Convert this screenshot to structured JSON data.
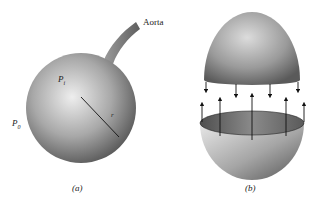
{
  "figure": {
    "panel_a": {
      "caption": "(a)",
      "vessel_label": "Aorta",
      "inner_pressure": {
        "symbol": "P",
        "subscript": "i"
      },
      "outer_pressure": {
        "symbol": "P",
        "subscript": "0"
      },
      "radius_label": "r"
    },
    "panel_b": {
      "caption": "(b)",
      "top_arrows_count": 4,
      "bottom_arrows_count": 5
    },
    "colors": {
      "shade_dark": "#5a5a5a",
      "shade_light": "#e6e6e6",
      "line": "#111111"
    }
  }
}
